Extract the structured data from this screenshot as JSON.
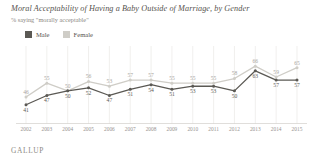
{
  "title": "Moral Acceptability of Having a Baby Outside of Marriage, by Gender",
  "subtitle": "% saying \"morally acceptable\"",
  "footer": "GALLUP",
  "legend": [
    {
      "label": "Male",
      "color": "#5b5954"
    },
    {
      "label": "Female",
      "color": "#cfcdc7"
    }
  ],
  "chart_data": {
    "type": "line",
    "title": "Moral Acceptability of Having a Baby Outside of Marriage, by Gender",
    "subtitle": "% saying \"morally acceptable\"",
    "xlabel": "",
    "ylabel": "",
    "ylim": [
      35,
      70
    ],
    "grid": true,
    "legend_position": "top-left",
    "categories": [
      "2002",
      "2003",
      "2004",
      "2005",
      "2006",
      "2007",
      "2008",
      "2009",
      "2010",
      "2011",
      "2012",
      "2013",
      "2014",
      "2015"
    ],
    "series": [
      {
        "name": "Male",
        "color": "#5b5954",
        "values": [
          41,
          47,
          50,
          52,
          47,
          51,
          54,
          51,
          53,
          53,
          50,
          63,
          57,
          57
        ]
      },
      {
        "name": "Female",
        "color": "#cfcdc7",
        "values": [
          46,
          55,
          50,
          56,
          53,
          57,
          57,
          55,
          55,
          55,
          58,
          66,
          59,
          65
        ]
      }
    ]
  }
}
